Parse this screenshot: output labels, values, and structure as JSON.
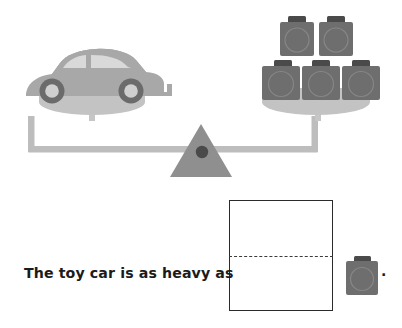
{
  "page": {
    "width": 402,
    "height": 328,
    "background": "#ffffff",
    "kind": "worksheet-balance-scale-question"
  },
  "colors": {
    "weight_body": "#6e6e6e",
    "weight_tab": "#4a4a4a",
    "weight_circle_outline": "#8a8a8a",
    "car_body": "#a8a8a8",
    "car_window": "#d8d8d8",
    "car_tyre": "#6b6b6b",
    "car_hub": "#d0d0d0",
    "pan": "#c0c0c0",
    "beam": "#bdbdbd",
    "fulcrum": "#8f8f8f",
    "pivot_dot": "#4a4a4a",
    "box_border": "#2b2b2b",
    "guideline": "#3a3a3a",
    "text": "#1b1b1b"
  },
  "scale": {
    "label": "balance-scale",
    "state": "balanced",
    "left_pan": {
      "label": "left-pan",
      "contents": "toy car",
      "item_count": 1
    },
    "right_pan": {
      "label": "right-pan",
      "contents": "weights",
      "item_count": 5,
      "rows": [
        {
          "row": "top",
          "count": 2
        },
        {
          "row": "bottom",
          "count": 3
        }
      ]
    },
    "fulcrum": {
      "label": "fulcrum-triangle"
    }
  },
  "question": {
    "sentence": "The toy car is as heavy as",
    "answer_value": "",
    "answer_placeholder": "",
    "unit_icon": "weight-icon",
    "terminator": "."
  },
  "icons": {
    "car": "toy-car-icon",
    "weight": "weight-icon",
    "triangle": "fulcrum-triangle-icon"
  }
}
